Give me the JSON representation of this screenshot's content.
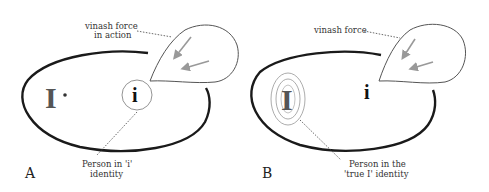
{
  "panels": {
    "a": {
      "letter": "A",
      "big_symbol": "I",
      "small_symbol": "i",
      "force_label_line1": "vinash force",
      "force_label_line2": "in action",
      "person_label_line1": "Person in 'i'",
      "person_label_line2": "identity"
    },
    "b": {
      "letter": "B",
      "big_symbol": "I",
      "small_symbol": "i",
      "force_label_line1": "vinash force",
      "person_label_line1": "Person in the",
      "person_label_line2": "'true I' identity"
    }
  },
  "colors": {
    "ellipse_stroke": "#1a1a1a",
    "blob_stroke": "#555555",
    "arrow": "#999999",
    "leader": "#444444",
    "rings": "#888888"
  }
}
